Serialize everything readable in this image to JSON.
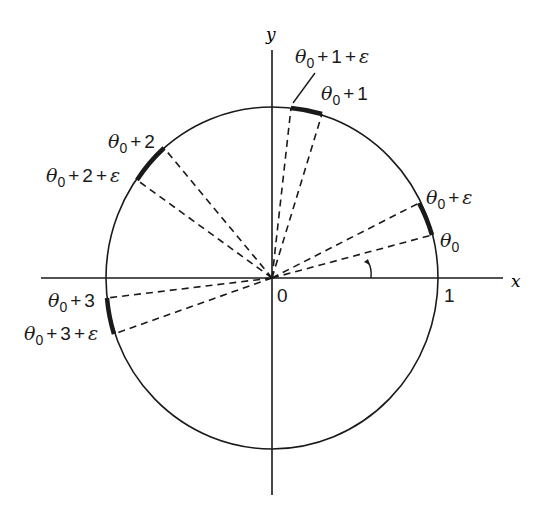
{
  "diagram": {
    "title": "",
    "axes": {
      "x_label": "x",
      "y_label": "y",
      "origin_label": "0",
      "unit_label": "1"
    },
    "angle_labels": [
      {
        "id": "t0",
        "text": "θ0"
      },
      {
        "id": "t0e",
        "text": "θ0 + ε"
      },
      {
        "id": "t1",
        "text": "θ0 + 1"
      },
      {
        "id": "t1e",
        "text": "θ0 + 1 + ε"
      },
      {
        "id": "t2",
        "text": "θ0 + 2"
      },
      {
        "id": "t2e",
        "text": "θ0 + 2 + ε"
      },
      {
        "id": "t3",
        "text": "θ0 + 3"
      },
      {
        "id": "t3e",
        "text": "θ0 + 3 + ε"
      }
    ],
    "symbols": {
      "theta": "θ",
      "sub0": "0",
      "plus": "+",
      "eps": "ε",
      "one": "1",
      "two": "2",
      "three": "3"
    },
    "colors": {
      "ink": "#1a1a1a",
      "background": "#ffffff"
    }
  }
}
